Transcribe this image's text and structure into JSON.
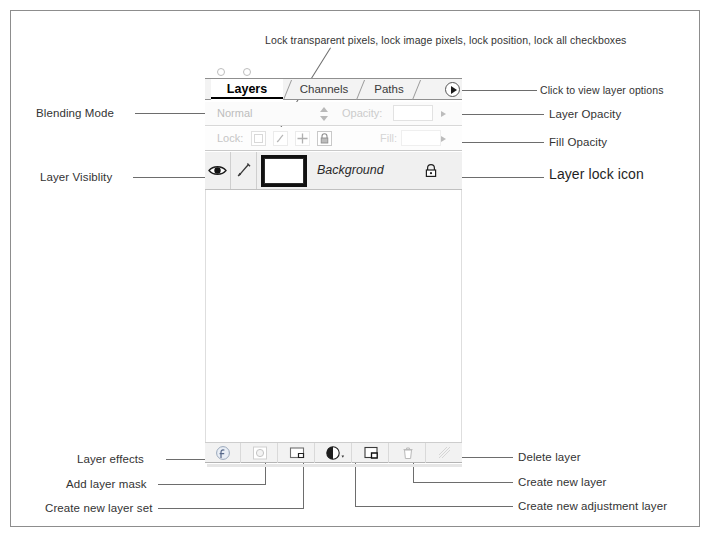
{
  "annotations": {
    "top_callout": "Lock transparent pixels, lock image pixels, lock position, lock all checkboxes",
    "left": [
      {
        "id": "blending-mode",
        "label": "Blending Mode"
      },
      {
        "id": "layer-visibility",
        "label": "Layer Visiblity"
      },
      {
        "id": "layer-effects",
        "label": "Layer effects"
      },
      {
        "id": "add-layer-mask",
        "label": "Add layer mask"
      },
      {
        "id": "create-new-layer-set",
        "label": "Create new layer set"
      }
    ],
    "right": [
      {
        "id": "view-layer-options",
        "label": "Click to view layer options"
      },
      {
        "id": "layer-opacity",
        "label": "Layer Opacity"
      },
      {
        "id": "fill-opacity",
        "label": "Fill Opacity"
      },
      {
        "id": "layer-lock-icon",
        "label": "Layer lock icon"
      },
      {
        "id": "delete-layer",
        "label": "Delete layer"
      },
      {
        "id": "create-new-layer",
        "label": "Create new layer"
      },
      {
        "id": "create-new-adjustment-layer",
        "label": "Create new adjustment layer"
      }
    ]
  },
  "palette": {
    "tabs": [
      {
        "label": "Layers",
        "active": true
      },
      {
        "label": "Channels",
        "active": false
      },
      {
        "label": "Paths",
        "active": false
      }
    ],
    "options_button_icon": "triangle-right-icon",
    "blend": {
      "mode": "Normal",
      "opacity_label": "Opacity:",
      "opacity_value": ""
    },
    "lock": {
      "label": "Lock:",
      "fill_label": "Fill:",
      "fill_value": "",
      "checkboxes": [
        {
          "name": "lock-transparent-pixels",
          "icon": "checkerboard-icon"
        },
        {
          "name": "lock-image-pixels",
          "icon": "brush-icon"
        },
        {
          "name": "lock-position",
          "icon": "move-cross-icon"
        },
        {
          "name": "lock-all",
          "icon": "padlock-icon"
        }
      ]
    },
    "layer": {
      "name": "Background",
      "visible": true,
      "locked": true,
      "visibility_icon": "eye-icon",
      "brush_icon": "paintbrush-icon",
      "lock_icon": "padlock-icon"
    },
    "toolbar": [
      {
        "name": "layer-effects-button",
        "icon": "layer-effects-icon"
      },
      {
        "name": "add-layer-mask-button",
        "icon": "layer-mask-icon"
      },
      {
        "name": "create-new-layer-set-button",
        "icon": "folder-icon"
      },
      {
        "name": "create-new-adjustment-layer-button",
        "icon": "half-circle-icon"
      },
      {
        "name": "create-new-layer-button",
        "icon": "new-layer-icon"
      },
      {
        "name": "delete-layer-button",
        "icon": "trash-icon"
      },
      {
        "name": "extra-button",
        "icon": "diagonal-lines-icon"
      }
    ]
  },
  "colors": {
    "frame": "#8d8d8d",
    "leader": "#6d6d6d",
    "panel_bg": "#f2f2f2",
    "text": "#333333"
  }
}
